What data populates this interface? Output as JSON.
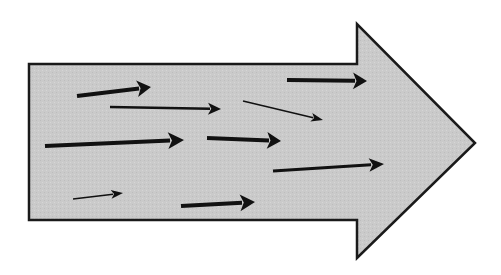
{
  "diagram": {
    "title": "",
    "width": 501,
    "height": 275,
    "background": "#ffffff",
    "big_arrow": {
      "fill": "#c9c9c9",
      "stroke": "#1a1a1a",
      "stroke_width": 2.5,
      "points": [
        [
          29,
          64
        ],
        [
          357,
          64
        ],
        [
          357,
          24
        ],
        [
          475,
          143
        ],
        [
          357,
          258
        ],
        [
          357,
          220
        ],
        [
          29,
          220
        ]
      ]
    },
    "small_arrows": [
      {
        "id": "a1",
        "x1": 77,
        "y1": 96,
        "x2": 151,
        "y2": 87,
        "weight": 4.0,
        "head": 14
      },
      {
        "id": "a2",
        "x1": 110,
        "y1": 107,
        "x2": 221,
        "y2": 109,
        "weight": 2.5,
        "head": 13
      },
      {
        "id": "a3",
        "x1": 287,
        "y1": 80,
        "x2": 367,
        "y2": 81,
        "weight": 4.0,
        "head": 14
      },
      {
        "id": "a4",
        "x1": 243,
        "y1": 101,
        "x2": 323,
        "y2": 120,
        "weight": 1.5,
        "head": 12
      },
      {
        "id": "a5",
        "x1": 45,
        "y1": 146,
        "x2": 184,
        "y2": 140,
        "weight": 4.0,
        "head": 16
      },
      {
        "id": "a6",
        "x1": 207,
        "y1": 138,
        "x2": 281,
        "y2": 141,
        "weight": 4.0,
        "head": 14
      },
      {
        "id": "a7",
        "x1": 273,
        "y1": 171,
        "x2": 384,
        "y2": 164,
        "weight": 3.0,
        "head": 15
      },
      {
        "id": "a8",
        "x1": 73,
        "y1": 199,
        "x2": 123,
        "y2": 193,
        "weight": 1.5,
        "head": 12
      },
      {
        "id": "a9",
        "x1": 181,
        "y1": 206,
        "x2": 255,
        "y2": 202,
        "weight": 4.0,
        "head": 15
      }
    ],
    "arrow_color": "#111111"
  }
}
